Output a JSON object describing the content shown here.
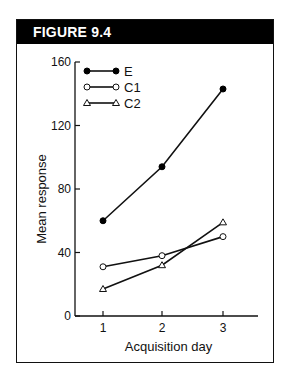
{
  "figure": {
    "label": "FIGURE  9.4"
  },
  "chart_data": {
    "type": "line",
    "title": "",
    "xlabel": "Acquisition day",
    "ylabel": "Mean response",
    "x": [
      1,
      2,
      3
    ],
    "xticks": [
      "1",
      "2",
      "3"
    ],
    "yticks": [
      "0",
      "40",
      "80",
      "120",
      "160"
    ],
    "ylim": [
      0,
      160
    ],
    "legend_position": "top-left",
    "series": [
      {
        "name": "E",
        "marker": "filled-circle",
        "values": [
          60,
          94,
          143
        ]
      },
      {
        "name": "C1",
        "marker": "open-circle",
        "values": [
          31,
          38,
          50
        ]
      },
      {
        "name": "C2",
        "marker": "open-triangle",
        "values": [
          17,
          32,
          59
        ]
      }
    ]
  }
}
